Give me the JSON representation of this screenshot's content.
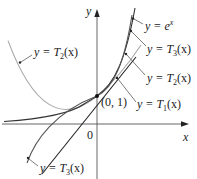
{
  "figure": {
    "type": "function-graph",
    "axes": {
      "x_label": "x",
      "y_label": "y",
      "origin_label": "0"
    },
    "point": {
      "label": "(0, 1)",
      "x": 0,
      "y": 1
    },
    "curves": [
      {
        "name": "exp",
        "label_lhs": "y = e",
        "label_sup": "x",
        "color": "#333333"
      },
      {
        "name": "T3",
        "label": "y = T3(x)",
        "color": "#555555"
      },
      {
        "name": "T2",
        "label": "y = T2(x)",
        "color": "#999999"
      },
      {
        "name": "T1",
        "label": "y = T1(x)",
        "color": "#222222"
      }
    ],
    "labels": {
      "exp": {
        "prefix": "y = e",
        "sup": "x"
      },
      "t3_right": {
        "prefix": "y = T",
        "sub": "3",
        "suffix": "(x)"
      },
      "t2_right": {
        "prefix": "y = T",
        "sub": "2",
        "suffix": "(x)"
      },
      "t1_right": {
        "prefix": "y = T",
        "sub": "1",
        "suffix": "(x)"
      },
      "t2_left": {
        "prefix": "y = T",
        "sub": "2",
        "suffix": "(x)"
      },
      "t3_bottom": {
        "prefix": "y = T",
        "sub": "3",
        "suffix": "(x)"
      }
    }
  }
}
